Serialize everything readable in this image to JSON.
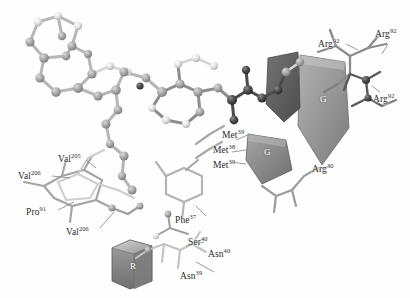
{
  "figure": {
    "kind": "molecular-structure-rendering",
    "background_color": "#fefefe",
    "palette": {
      "background": "#fefefe",
      "atom_light": "#e8e8e8",
      "atom_mid": "#a8a8a8",
      "atom_dark": "#3c3c3c",
      "bond_light": "#d8d8d8",
      "bond_mid": "#9a9a9a",
      "bond_dark": "#4a4a4a",
      "ribbon_gray": "#8f8f8f",
      "ribbon_dark": "#5d5d5d",
      "ribbon_light": "#c9c9c9",
      "label_text": "#2b2b2b",
      "ribbon_letter": "#ffffff"
    }
  },
  "residue_labels": [
    {
      "id": "val-206-upper",
      "name": "Val",
      "superscript": "206",
      "x": 18,
      "y": 172
    },
    {
      "id": "val-205",
      "name": "Val",
      "superscript": "205",
      "x": 58,
      "y": 155
    },
    {
      "id": "pro-91",
      "name": "Pro",
      "superscript": "91",
      "x": 26,
      "y": 208
    },
    {
      "id": "val-206-lower",
      "name": "Val",
      "superscript": "206",
      "x": 66,
      "y": 228
    },
    {
      "id": "phe-37",
      "name": "Phe",
      "superscript": "37",
      "x": 175,
      "y": 216
    },
    {
      "id": "ser-40",
      "name": "Ser",
      "superscript": "40",
      "x": 188,
      "y": 238
    },
    {
      "id": "asn-40",
      "name": "Asn",
      "superscript": "40",
      "x": 208,
      "y": 250
    },
    {
      "id": "asn-39",
      "name": "Asn",
      "superscript": "39",
      "x": 180,
      "y": 272
    },
    {
      "id": "met-39-upper",
      "name": "Met",
      "superscript": "39",
      "x": 222,
      "y": 131
    },
    {
      "id": "met-38",
      "name": "Met",
      "superscript": "38",
      "x": 213,
      "y": 146
    },
    {
      "id": "met-39-lower",
      "name": "Met",
      "superscript": "39",
      "x": 213,
      "y": 161
    },
    {
      "id": "arg-92-left",
      "name": "Arg",
      "superscript": "92",
      "x": 318,
      "y": 40
    },
    {
      "id": "arg-92-top",
      "name": "Arg",
      "superscript": "92",
      "x": 375,
      "y": 30
    },
    {
      "id": "arg-92-right",
      "name": "Arg",
      "superscript": "92",
      "x": 373,
      "y": 95
    },
    {
      "id": "arg-30",
      "name": "Arg",
      "superscript": "30",
      "x": 312,
      "y": 165
    }
  ],
  "secondary_structure_labels": [
    {
      "id": "strand-g-large",
      "letter": "G",
      "x": 320,
      "y": 95,
      "shape": "beta-strand-arrow"
    },
    {
      "id": "strand-g-small",
      "letter": "G",
      "x": 264,
      "y": 148,
      "shape": "beta-strand-arrow"
    },
    {
      "id": "helix-r",
      "letter": "R",
      "x": 130,
      "y": 262,
      "shape": "helix-block"
    }
  ]
}
